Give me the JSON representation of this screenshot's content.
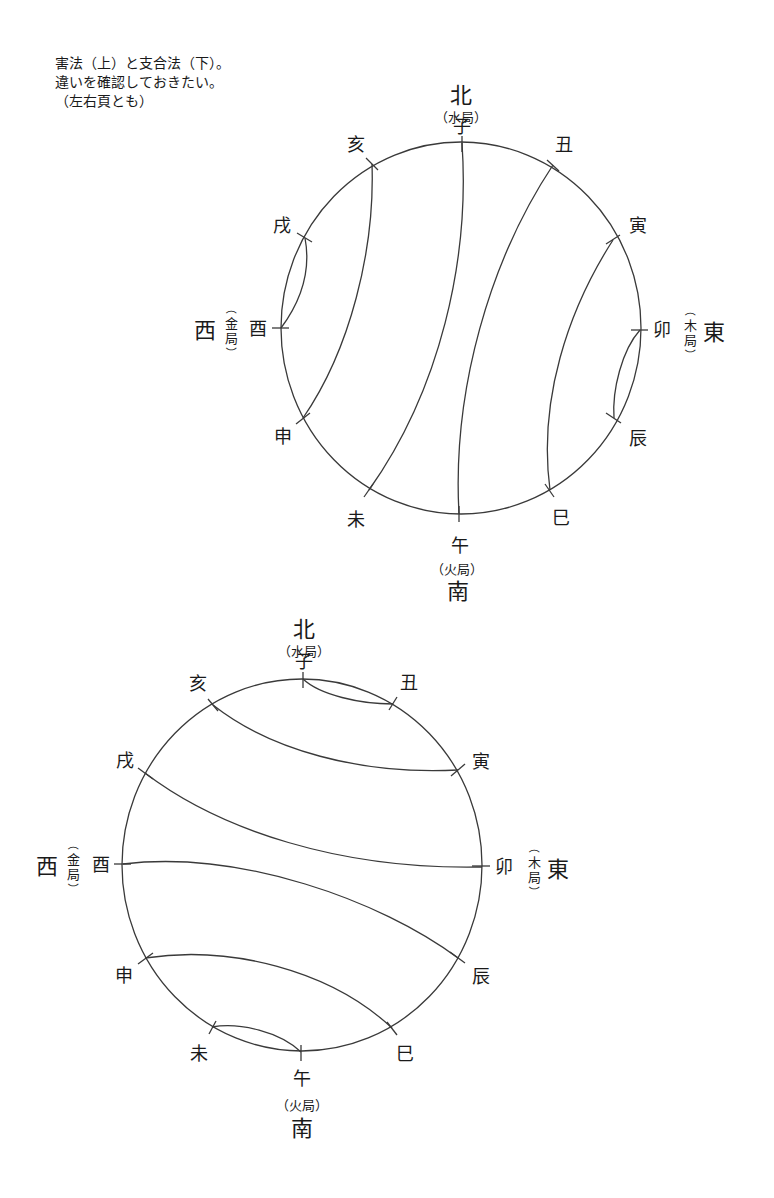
{
  "note": {
    "lines": [
      "害法（上）と支合法（下）。",
      "違いを確認しておきたい。",
      "（左右頁とも）"
    ]
  },
  "directions": {
    "north": {
      "label": "北",
      "element": "（水局）"
    },
    "south": {
      "label": "南",
      "element": "（火局）"
    },
    "west": {
      "label": "西",
      "element_vertical": [
        "（",
        "金",
        "局",
        "）"
      ]
    },
    "east": {
      "label": "東",
      "element_vertical": [
        "（",
        "木",
        "局",
        "）"
      ]
    }
  },
  "branches": [
    "子",
    "丑",
    "寅",
    "卯",
    "辰",
    "巳",
    "午",
    "未",
    "申",
    "酉",
    "戌",
    "亥"
  ],
  "diagrams": [
    {
      "name": "害法",
      "position": "top",
      "pairs": [
        [
          "子",
          "未"
        ],
        [
          "丑",
          "午"
        ],
        [
          "寅",
          "巳"
        ],
        [
          "卯",
          "辰"
        ],
        [
          "申",
          "亥"
        ],
        [
          "酉",
          "戌"
        ]
      ]
    },
    {
      "name": "支合法",
      "position": "bottom",
      "pairs": [
        [
          "子",
          "丑"
        ],
        [
          "寅",
          "亥"
        ],
        [
          "卯",
          "戌"
        ],
        [
          "辰",
          "酉"
        ],
        [
          "巳",
          "申"
        ],
        [
          "午",
          "未"
        ]
      ]
    }
  ],
  "colors": {
    "line": "#3a3a3a",
    "text": "#1a1a1a",
    "background": "#ffffff"
  }
}
